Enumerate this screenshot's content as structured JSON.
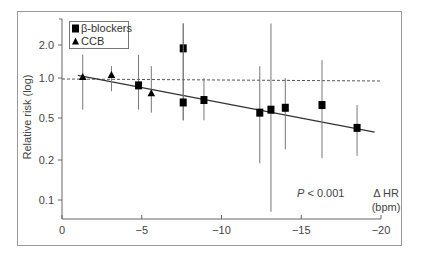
{
  "chart_data": {
    "type": "scatter",
    "title": "",
    "xlabel": "Δ HR (bpm)",
    "xlabel_lines": [
      "Δ HR",
      "(bpm)"
    ],
    "ylabel": "Relative risk (log)",
    "yscale": "log",
    "xlim": [
      0,
      -20
    ],
    "ylim": [
      0.06,
      2.8
    ],
    "x_ticks": [
      {
        "value": 0,
        "label": "0"
      },
      {
        "value": -5,
        "label": "−5"
      },
      {
        "value": -10,
        "label": "−10"
      },
      {
        "value": -15,
        "label": "−15"
      },
      {
        "value": -20,
        "label": "−20"
      }
    ],
    "y_ticks": [
      {
        "value": 2.0,
        "label": "2.0"
      },
      {
        "value": 1.0,
        "label": "1.0"
      },
      {
        "value": 0.5,
        "label": "0.5"
      },
      {
        "value": 0.2,
        "label": "0.2"
      },
      {
        "value": 0.1,
        "label": "0.1"
      }
    ],
    "grid": false,
    "legend_position": "top-left",
    "legend": [
      {
        "name": "β-blockers",
        "marker": "square"
      },
      {
        "name": "CCB",
        "marker": "triangle"
      }
    ],
    "series": [
      {
        "name": "CCB",
        "marker": "triangle",
        "points": [
          {
            "x": -1.3,
            "y": 1.02,
            "ci_low": 0.55,
            "ci_high": 1.55
          },
          {
            "x": -3.1,
            "y": 1.06,
            "ci_low": 0.78,
            "ci_high": 1.25
          },
          {
            "x": -5.6,
            "y": 0.75,
            "ci_low": 0.52,
            "ci_high": 1.25
          }
        ]
      },
      {
        "name": "β-blockers",
        "marker": "square",
        "points": [
          {
            "x": -4.8,
            "y": 0.87,
            "ci_low": 0.55,
            "ci_high": 1.55
          },
          {
            "x": -7.6,
            "y": 1.75,
            "ci_low": 0.45,
            "ci_high": 2.8
          },
          {
            "x": -7.6,
            "y": 0.63,
            "ci_low": 0.45,
            "ci_high": 2.8
          },
          {
            "x": -8.9,
            "y": 0.66,
            "ci_low": 0.45,
            "ci_high": 1.0
          },
          {
            "x": -12.4,
            "y": 0.52,
            "ci_low": 0.2,
            "ci_high": 1.25
          },
          {
            "x": -13.1,
            "y": 0.55,
            "ci_low": 0.08,
            "ci_high": 2.8
          },
          {
            "x": -14.0,
            "y": 0.57,
            "ci_low": 0.26,
            "ci_high": 1.0
          },
          {
            "x": -16.3,
            "y": 0.6,
            "ci_low": 0.22,
            "ci_high": 1.4
          },
          {
            "x": -18.5,
            "y": 0.39,
            "ci_low": 0.23,
            "ci_high": 0.6
          }
        ]
      }
    ],
    "reference_line": {
      "y": 1.0,
      "style": "dashed",
      "x_from": 0,
      "x_to": -20
    },
    "trend_line": {
      "x_from": -1.0,
      "y_from": 1.05,
      "x_to": -19.6,
      "y_to": 0.36
    },
    "annotations": [
      {
        "text": "P < 0.001",
        "italic_prefix": "P",
        "rest": " < 0.001",
        "x": -14,
        "y": 0.075
      }
    ]
  }
}
